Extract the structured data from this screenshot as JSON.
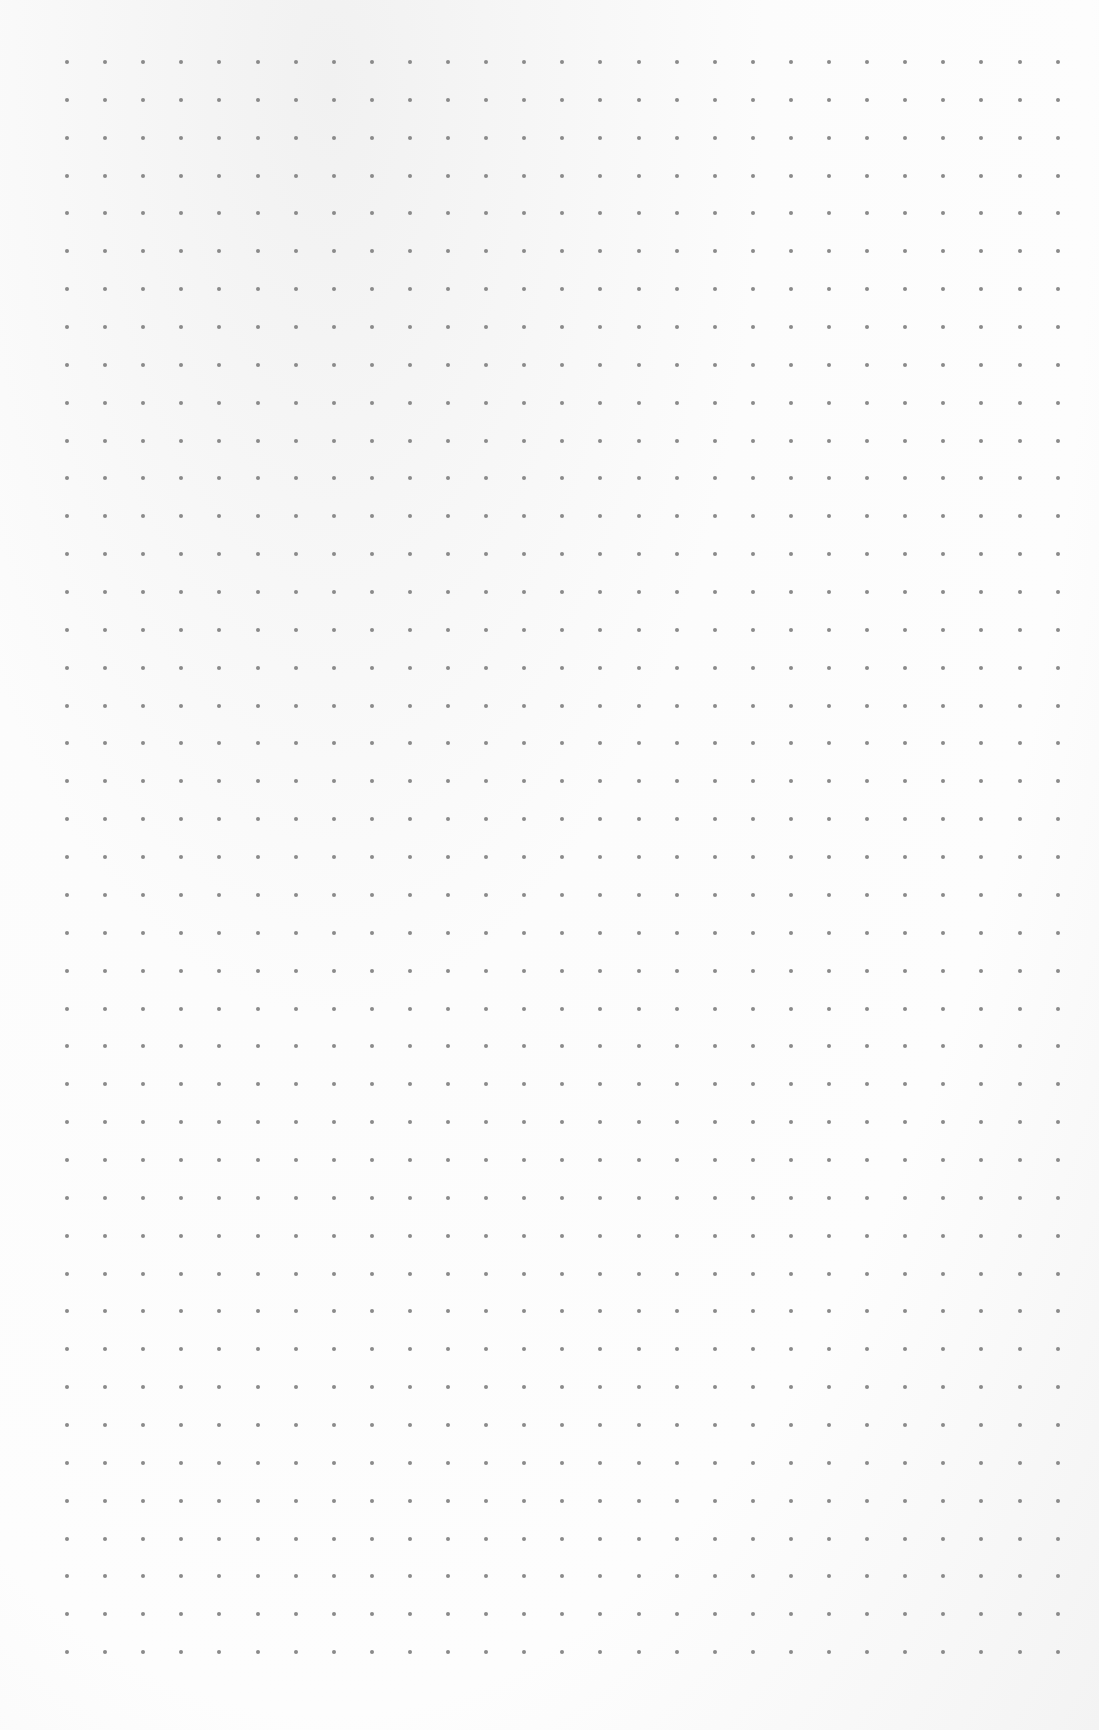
{
  "page": {
    "type": "dot-grid-paper",
    "background_color": "#fbfbfb",
    "dot_color": "#8a8a8a"
  },
  "grid": {
    "columns": 27,
    "rows": 43,
    "origin_x": 67,
    "origin_y": 62,
    "spacing_x": 38.1,
    "spacing_y": 37.86,
    "dot_size": 4
  }
}
